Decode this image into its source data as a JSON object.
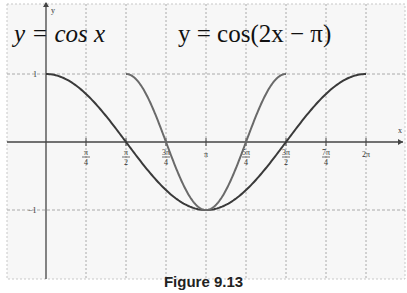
{
  "chart_data": {
    "type": "line",
    "title": "Figure 9.13",
    "xlabel": "x",
    "ylabel": "y",
    "xlim": [
      -0.8,
      7.0
    ],
    "ylim": [
      -1.2,
      1.0
    ],
    "grid": true,
    "x_tick_labels": [
      "π/4",
      "π/2",
      "3π/4",
      "π",
      "5π/4",
      "3π/2",
      "7π/4",
      "2π"
    ],
    "y_tick_labels": [
      "1",
      "−1"
    ],
    "series": [
      {
        "name": "y = cos x",
        "domain": [
          0,
          6.2832
        ],
        "x": [
          0,
          0.7854,
          1.5708,
          2.3562,
          3.1416,
          3.927,
          4.7124,
          5.4978,
          6.2832
        ],
        "y": [
          1,
          0.707,
          0,
          -0.707,
          -1,
          -0.707,
          0,
          0.707,
          1
        ]
      },
      {
        "name": "y = cos(2x − π)",
        "domain": [
          1.5708,
          4.7124
        ],
        "x": [
          1.5708,
          1.9635,
          2.3562,
          2.7489,
          3.1416,
          3.5343,
          3.927,
          4.3197,
          4.7124
        ],
        "y": [
          1,
          0.707,
          0,
          -0.707,
          -1,
          -0.707,
          0,
          0.707,
          1
        ]
      }
    ],
    "annotations": [
      "y = cos x",
      "y = cos(2x − π)"
    ]
  },
  "labels": {
    "eq1": "y = cos x",
    "eq2": "y = cos(2x − π)",
    "x_axis": "x",
    "y_axis": "y",
    "y1": "1",
    "ym1": "−1",
    "caption": "Figure 9.13"
  }
}
